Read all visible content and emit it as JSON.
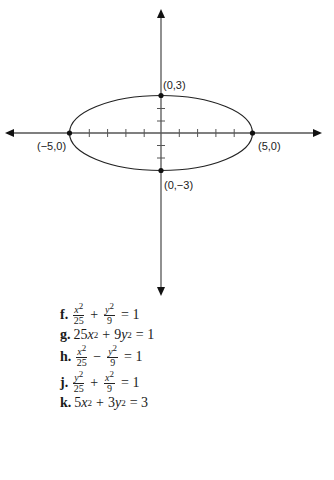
{
  "graph": {
    "type": "ellipse",
    "equation": "x^2/25 + y^2/9 = 1",
    "semi_major_axis": 5,
    "semi_minor_axis": 3,
    "points": [
      {
        "label": "(0,3)",
        "x": 0,
        "y": 3
      },
      {
        "label": "(−5,0)",
        "x": -5,
        "y": 0
      },
      {
        "label": "(5,0)",
        "x": 5,
        "y": 0
      },
      {
        "label": "(0,−3)",
        "x": 0,
        "y": -3
      }
    ],
    "x_ticks": [
      -5,
      -4,
      -3,
      -2,
      -1,
      1,
      2,
      3,
      4,
      5
    ],
    "y_ticks": [
      -3,
      -2,
      -1,
      1,
      2,
      3
    ],
    "axis_color": "#555555",
    "curve_color": "#222222"
  },
  "equations": [
    {
      "label": "f.",
      "text": "x²/25 + y²/9 = 1"
    },
    {
      "label": "g.",
      "text": "25x² + 9y² = 1"
    },
    {
      "label": "h.",
      "text": "x²/25 − y²/9 = 1"
    },
    {
      "label": "j.",
      "text": "y²/25 + x²/9 = 1"
    },
    {
      "label": "k.",
      "text": "5x² + 3y² = 3"
    }
  ],
  "eq_parts": {
    "f": {
      "label": "f.",
      "n1": "x",
      "d1": "25",
      "op": "+",
      "n2": "y",
      "d2": "9",
      "rhs": "= 1"
    },
    "g": {
      "label": "g.",
      "a": "25",
      "b": "9",
      "rhs": "= 1"
    },
    "h": {
      "label": "h.",
      "n1": "x",
      "d1": "25",
      "op": "−",
      "n2": "y",
      "d2": "9",
      "rhs": "= 1"
    },
    "j": {
      "label": "j.",
      "n1": "y",
      "d1": "25",
      "op": "+",
      "n2": "x",
      "d2": "9",
      "rhs": "= 1"
    },
    "k": {
      "label": "k.",
      "a": "5",
      "b": "3",
      "rhs": "= 3"
    }
  }
}
